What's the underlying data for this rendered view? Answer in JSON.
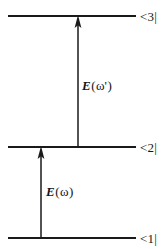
{
  "figure": {
    "kind": "energy-level-diagram",
    "background_color": "#ffffff",
    "ink_color": "#1a1a1a",
    "width": 168,
    "height": 249
  },
  "levels": [
    {
      "id": "state-3",
      "label": "<3|",
      "y": 16,
      "x_start": 8,
      "x_end": 136
    },
    {
      "id": "state-2",
      "label": "<2|",
      "y": 147,
      "x_start": 8,
      "x_end": 136
    },
    {
      "id": "state-1",
      "label": "<1|",
      "y": 238,
      "x_start": 8,
      "x_end": 136
    }
  ],
  "transitions": [
    {
      "id": "upper-transition",
      "from_level": "state-2",
      "to_level": "state-3",
      "x": 78,
      "y_tail": 147,
      "y_head": 16,
      "direction": "up",
      "field_symbol": "E",
      "field_open_paren": "(",
      "field_argument": "ω'",
      "field_close_paren": ")",
      "field_label": "E(ω')"
    },
    {
      "id": "lower-transition",
      "from_level": "state-1",
      "to_level": "state-2",
      "x": 41,
      "y_tail": 238,
      "y_head": 147,
      "direction": "up",
      "field_symbol": "E",
      "field_open_paren": "(",
      "field_argument": "ω",
      "field_close_paren": ")",
      "field_label": "E(ω)"
    }
  ]
}
